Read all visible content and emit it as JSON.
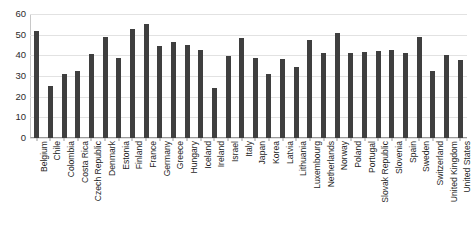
{
  "chart_data": {
    "type": "bar",
    "title": "",
    "subtitle": "",
    "xlabel": "",
    "ylabel": "",
    "ylim": [
      0,
      60
    ],
    "yticks": [
      0,
      10,
      20,
      30,
      40,
      50,
      60
    ],
    "ytick_labels": [
      "0",
      "10",
      "20",
      "30",
      "40",
      "50",
      "60"
    ],
    "grid": true,
    "legend": false,
    "legend_position": "none",
    "bar_color": "#3f3f3f",
    "gridline_color": "#e2e2e2",
    "axis_color": "#9a9a9a",
    "categories": [
      "Belgium",
      "Chile",
      "Colombia",
      "Costa Rica",
      "Czech Republic",
      "Denmark",
      "Estonia",
      "Finland",
      "France",
      "Germany",
      "Greece",
      "Hungary",
      "Iceland",
      "Ireland",
      "Israel",
      "Italy",
      "Japan",
      "Korea",
      "Latvia",
      "Lithuania",
      "Luxembourg",
      "Netherlands",
      "Norway",
      "Poland",
      "Portugal",
      "Slovak Republic",
      "Slovenia",
      "Spain",
      "Sweden",
      "Switzerland",
      "United Kingdom",
      "United States"
    ],
    "values": [
      51.8,
      25.2,
      31.0,
      32.4,
      40.8,
      48.8,
      38.6,
      52.9,
      55.4,
      44.4,
      46.7,
      45.0,
      42.8,
      24.2,
      39.6,
      48.2,
      38.7,
      30.9,
      38.0,
      34.2,
      47.2,
      41.3,
      50.8,
      41.0,
      41.7,
      42.0,
      42.6,
      41.2,
      48.8,
      32.3,
      40.1,
      37.6
    ]
  }
}
